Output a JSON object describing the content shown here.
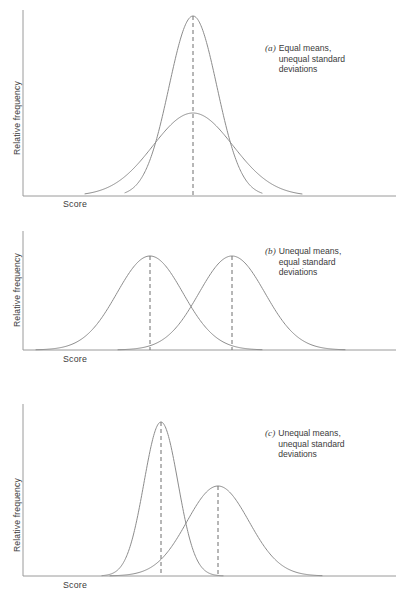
{
  "figure": {
    "width": 411,
    "height": 604,
    "background": "#ffffff",
    "curve_color": "#8c8c8c",
    "axis_color": "#9a9a9a",
    "dash_color": "#6e6e6e",
    "text_color": "#3b3b3b"
  },
  "panels": [
    {
      "id": "a",
      "tag": "(a)",
      "caption_lines": [
        "Equal means,",
        "unequal standard",
        "deviations"
      ],
      "caption_text": "Equal means, unequal standard deviations",
      "ylabel": "Relative frequency",
      "xlabel": "Score",
      "box": {
        "x": 0,
        "y": 0,
        "w": 411,
        "h": 205
      },
      "axes": {
        "x0": 23,
        "y_top": 10,
        "y_base": 196,
        "x_end": 396
      },
      "xlabel_pos": {
        "x": 63,
        "y": 199
      },
      "ylabel_pos": {
        "x": 12,
        "y": 155
      },
      "caption_pos": {
        "x": 265,
        "y": 43
      },
      "dashes": [
        {
          "x": 193,
          "y_top": 16
        }
      ],
      "curves": [
        {
          "name": "narrow-curve",
          "mean": 193,
          "sigma": 24,
          "peak_y": 16,
          "x_min": 125,
          "x_max": 262
        },
        {
          "name": "wide-curve",
          "mean": 193,
          "sigma": 40,
          "peak_y": 113,
          "x_min": 85,
          "x_max": 302
        }
      ]
    },
    {
      "id": "b",
      "tag": "(b)",
      "caption_lines": [
        "Unequal means,",
        "equal standard",
        "deviations"
      ],
      "caption_text": "Unequal means, equal standard deviations",
      "ylabel": "Relative frequency",
      "xlabel": "Score",
      "box": {
        "x": 0,
        "y": 205,
        "w": 411,
        "h": 195
      },
      "axes": {
        "x0": 23,
        "y_top": 26,
        "y_base": 145,
        "x_end": 396
      },
      "xlabel_pos": {
        "x": 63,
        "y": 149
      },
      "ylabel_pos": {
        "x": 12,
        "y": 122
      },
      "caption_pos": {
        "x": 265,
        "y": 41
      },
      "dashes": [
        {
          "x": 150,
          "y_top": 51
        },
        {
          "x": 232,
          "y_top": 51
        }
      ],
      "curves": [
        {
          "name": "left-curve",
          "mean": 150,
          "sigma": 33,
          "peak_y": 51,
          "x_min": 36,
          "x_max": 262
        },
        {
          "name": "right-curve",
          "mean": 232,
          "sigma": 33,
          "peak_y": 51,
          "x_min": 118,
          "x_max": 345
        }
      ]
    },
    {
      "id": "c",
      "tag": "(c)",
      "caption_lines": [
        "Unequal means,",
        "unequal standard",
        "deviations"
      ],
      "caption_text": "Unequal means, unequal standard deviations",
      "ylabel": "Relative frequency",
      "xlabel": "Score",
      "box": {
        "x": 0,
        "y": 400,
        "w": 411,
        "h": 204
      },
      "axes": {
        "x0": 23,
        "y_top": 4,
        "y_base": 176,
        "x_end": 396
      },
      "xlabel_pos": {
        "x": 63,
        "y": 180
      },
      "ylabel_pos": {
        "x": 12,
        "y": 152
      },
      "caption_pos": {
        "x": 265,
        "y": 28
      },
      "dashes": [
        {
          "x": 161,
          "y_top": 22
        },
        {
          "x": 218,
          "y_top": 86
        }
      ],
      "curves": [
        {
          "name": "narrow-tall-curve",
          "mean": 161,
          "sigma": 17,
          "peak_y": 22,
          "x_min": 102,
          "x_max": 223
        },
        {
          "name": "wide-short-curve",
          "mean": 218,
          "sigma": 31,
          "peak_y": 86,
          "x_min": 110,
          "x_max": 322
        }
      ]
    }
  ],
  "chart_data": {
    "type": "line",
    "xlabel": "Score",
    "ylabel": "Relative frequency",
    "grid": false,
    "legend": "none",
    "axis_ticks": [],
    "panels": [
      {
        "label": "(a)",
        "description": "Equal means, unequal standard deviations",
        "series": [
          {
            "name": "narrow distribution",
            "distribution": "normal",
            "mean": 0,
            "sd": 1,
            "relative_peak_height": 1.0
          },
          {
            "name": "wide distribution",
            "distribution": "normal",
            "mean": 0,
            "sd": 1.67,
            "relative_peak_height": 0.46
          }
        ]
      },
      {
        "label": "(b)",
        "description": "Unequal means, equal standard deviations",
        "series": [
          {
            "name": "left distribution",
            "distribution": "normal",
            "mean": -1.25,
            "sd": 1,
            "relative_peak_height": 1.0
          },
          {
            "name": "right distribution",
            "distribution": "normal",
            "mean": 1.25,
            "sd": 1,
            "relative_peak_height": 1.0
          }
        ]
      },
      {
        "label": "(c)",
        "description": "Unequal means, unequal standard deviations",
        "series": [
          {
            "name": "narrow tall distribution",
            "distribution": "normal",
            "mean": -0.85,
            "sd": 1,
            "relative_peak_height": 1.0
          },
          {
            "name": "wide short distribution",
            "distribution": "normal",
            "mean": 0.85,
            "sd": 1.82,
            "relative_peak_height": 0.62
          }
        ]
      }
    ]
  }
}
